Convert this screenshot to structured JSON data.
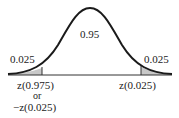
{
  "diagram": {
    "type": "normal-distribution",
    "center_area": "0.95",
    "left_tail_area": "0.025",
    "right_tail_area": "0.025",
    "left_cutoff_label_line1": "z(0.975)",
    "left_cutoff_label_line2": "or",
    "left_cutoff_label_line3": "−z(0.025)",
    "right_cutoff_label": "z(0.025)",
    "colors": {
      "curve": "#1a1a1a",
      "shade": "#c8c8c8",
      "axis": "#333333"
    }
  }
}
